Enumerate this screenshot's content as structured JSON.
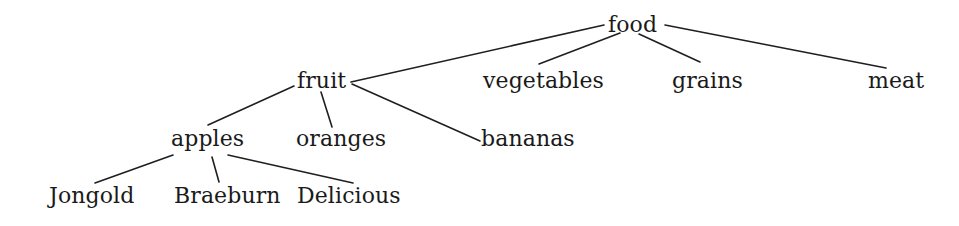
{
  "figure": {
    "width": 959,
    "height": 226,
    "background_color": "#ffffff",
    "text_color": "#1a1a1a",
    "edge_color": "#1f1f1f"
  },
  "nodes": [
    {
      "id": "food",
      "label": "food",
      "level": 0,
      "x": 608,
      "y": 14,
      "font_size": 22
    },
    {
      "id": "fruit",
      "label": "fruit",
      "level": 1,
      "x": 297,
      "y": 70,
      "font_size": 22
    },
    {
      "id": "vegetables",
      "label": "vegetables",
      "level": 1,
      "x": 483,
      "y": 70,
      "font_size": 22
    },
    {
      "id": "grains",
      "label": "grains",
      "level": 1,
      "x": 672,
      "y": 70,
      "font_size": 22
    },
    {
      "id": "meat",
      "label": "meat",
      "level": 1,
      "x": 868,
      "y": 70,
      "font_size": 22
    },
    {
      "id": "apples",
      "label": "apples",
      "level": 2,
      "x": 171,
      "y": 128,
      "font_size": 22
    },
    {
      "id": "oranges",
      "label": "oranges",
      "level": 2,
      "x": 296,
      "y": 128,
      "font_size": 22
    },
    {
      "id": "bananas",
      "label": "bananas",
      "level": 2,
      "x": 481,
      "y": 128,
      "font_size": 22
    },
    {
      "id": "Jongold",
      "label": "Jongold",
      "level": 3,
      "x": 49,
      "y": 185,
      "font_size": 22
    },
    {
      "id": "Braeburn",
      "label": "Braeburn",
      "level": 3,
      "x": 174,
      "y": 185,
      "font_size": 22
    },
    {
      "id": "Delicious",
      "label": "Delicious",
      "level": 3,
      "x": 297,
      "y": 185,
      "font_size": 22
    }
  ],
  "edges": [
    {
      "id": "food-fruit",
      "from": "food",
      "to": "fruit",
      "x1": 604,
      "y1": 25,
      "x2": 351,
      "y2": 82
    },
    {
      "id": "food-vegetables",
      "from": "food",
      "to": "vegetables",
      "x1": 620,
      "y1": 33,
      "x2": 539,
      "y2": 64
    },
    {
      "id": "food-grains",
      "from": "food",
      "to": "grains",
      "x1": 639,
      "y1": 34,
      "x2": 700,
      "y2": 62
    },
    {
      "id": "food-meat",
      "from": "food",
      "to": "meat",
      "x1": 665,
      "y1": 25,
      "x2": 886,
      "y2": 68
    },
    {
      "id": "fruit-apples",
      "from": "fruit",
      "to": "apples",
      "x1": 294,
      "y1": 86,
      "x2": 208,
      "y2": 125
    },
    {
      "id": "fruit-oranges",
      "from": "fruit",
      "to": "oranges",
      "x1": 321,
      "y1": 92,
      "x2": 332,
      "y2": 127
    },
    {
      "id": "fruit-bananas",
      "from": "fruit",
      "to": "bananas",
      "x1": 352,
      "y1": 84,
      "x2": 480,
      "y2": 141
    },
    {
      "id": "apples-Jongold",
      "from": "apples",
      "to": "Jongold",
      "x1": 173,
      "y1": 155,
      "x2": 95,
      "y2": 183
    },
    {
      "id": "apples-Braeburn",
      "from": "apples",
      "to": "Braeburn",
      "x1": 212,
      "y1": 157,
      "x2": 219,
      "y2": 182
    },
    {
      "id": "apples-Delicious",
      "from": "apples",
      "to": "Delicious",
      "x1": 228,
      "y1": 155,
      "x2": 353,
      "y2": 183
    }
  ]
}
